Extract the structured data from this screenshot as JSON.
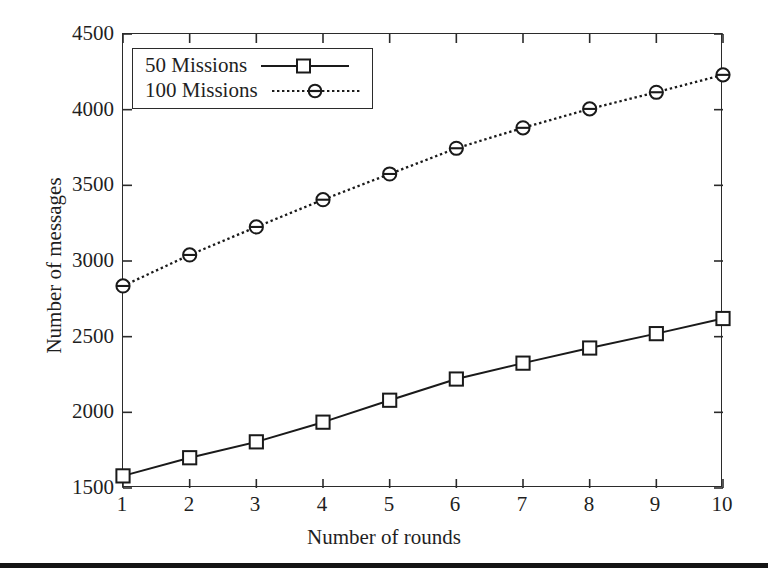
{
  "figure": {
    "background": "#ffffff",
    "ink_color": "#1f1f1f",
    "axis_color": "#2b2b2b"
  },
  "axes": {
    "ylabel": "Number of messages",
    "xlabel": "Number of rounds",
    "yticks": [
      "1500",
      "2000",
      "2500",
      "3000",
      "3500",
      "4000",
      "4500"
    ],
    "xticks": [
      "1",
      "2",
      "3",
      "4",
      "5",
      "6",
      "7",
      "8",
      "9",
      "10"
    ]
  },
  "legend": {
    "position": "top-left inside",
    "entries": [
      {
        "label": "50 Missions",
        "marker": "square",
        "line": "solid"
      },
      {
        "label": "100 Missions",
        "marker": "circle",
        "line": "dotted"
      }
    ]
  },
  "chart_data": {
    "type": "line",
    "title": "",
    "xlabel": "Number of rounds",
    "ylabel": "Number of messages",
    "x": [
      1,
      2,
      3,
      4,
      5,
      6,
      7,
      8,
      9,
      10
    ],
    "xlim": [
      1,
      10
    ],
    "ylim": [
      1500,
      4500
    ],
    "ytick_step": 500,
    "grid": false,
    "legend_position": "upper left",
    "series": [
      {
        "name": "50 Missions",
        "marker": "square",
        "linestyle": "solid",
        "color": "#1a1a1a",
        "values": [
          1580,
          1700,
          1805,
          1935,
          2080,
          2220,
          2325,
          2425,
          2520,
          2620
        ]
      },
      {
        "name": "100 Missions",
        "marker": "circle",
        "linestyle": "dotted",
        "color": "#1a1a1a",
        "values": [
          2835,
          3040,
          3225,
          3405,
          3575,
          3745,
          3880,
          4005,
          4115,
          4230
        ]
      }
    ]
  }
}
